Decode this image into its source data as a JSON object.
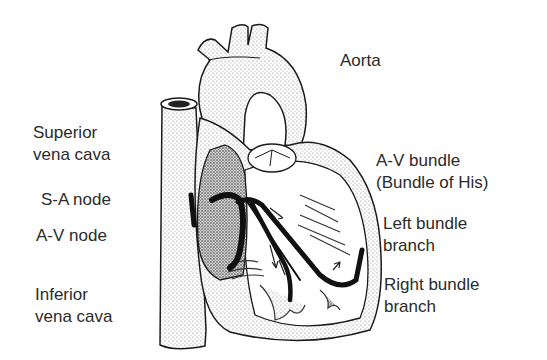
{
  "diagram": {
    "labels": {
      "aorta": "Aorta",
      "superior_vena_cava": [
        "Superior",
        "vena cava"
      ],
      "sa_node": "S-A node",
      "av_node": "A-V node",
      "inferior_vena_cava": [
        "Inferior",
        "vena cava"
      ],
      "av_bundle": [
        "A-V bundle",
        "(Bundle of His)"
      ],
      "left_bundle_branch": [
        "Left bundle",
        "branch"
      ],
      "right_bundle_branch": [
        "Right bundle",
        "branch"
      ]
    },
    "colors": {
      "background": "#ffffff",
      "ink": "#1a1a1a",
      "stipple": "#9a9a9a",
      "text": "#2b2b2b"
    }
  }
}
